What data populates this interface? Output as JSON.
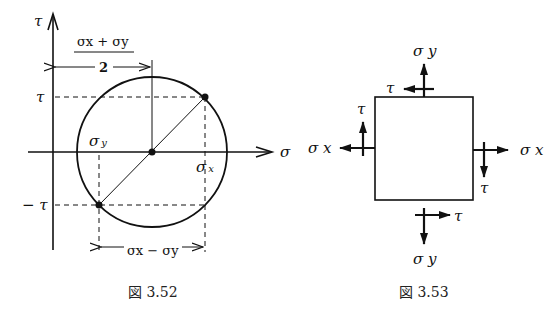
{
  "figure_352": {
    "caption": "図 3.52",
    "axis_vertical_label": "τ",
    "axis_horizontal_label": "σ",
    "label_tau": "τ",
    "label_neg_tau": "− τ",
    "label_sigma_y": "σ",
    "label_sigma_y_sub": "y",
    "label_sigma_x": "σ",
    "label_sigma_x_sub": "x",
    "center_formula_numerator": "σx + σy",
    "center_formula_denominator": "2",
    "diameter_formula": "σx − σy"
  },
  "figure_353": {
    "caption": "図 3.53",
    "top_normal": "σ y",
    "bottom_normal": "σ y",
    "left_normal": "σ x",
    "right_normal": "σ x",
    "top_shear": "τ",
    "left_shear": "τ",
    "right_shear": "τ",
    "bottom_shear": "τ"
  }
}
